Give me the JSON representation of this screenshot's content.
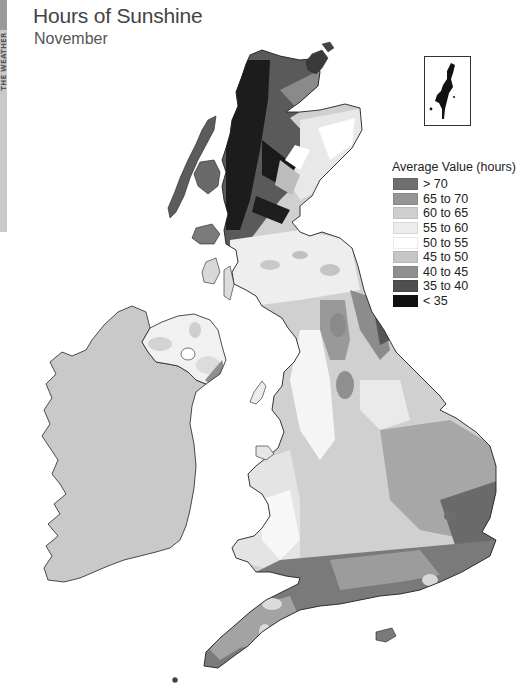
{
  "side_tab": {
    "label": "THE WEATHER"
  },
  "header": {
    "title": "Hours of Sunshine",
    "subtitle": "November"
  },
  "legend": {
    "title": "Average Value (hours)",
    "items": [
      {
        "label": "> 70",
        "color": "#6e6e6e"
      },
      {
        "label": "65 to 70",
        "color": "#959595"
      },
      {
        "label": "60 to 65",
        "color": "#cfcfcf"
      },
      {
        "label": "55 to 60",
        "color": "#ececec"
      },
      {
        "label": "50 to 55",
        "color": "#ffffff"
      },
      {
        "label": "45 to 50",
        "color": "#c6c6c6"
      },
      {
        "label": "40 to 45",
        "color": "#8f8f8f"
      },
      {
        "label": "35 to 40",
        "color": "#4f4f4f"
      },
      {
        "label": "< 35",
        "color": "#111111"
      }
    ]
  },
  "map": {
    "regions": [
      "Scotland",
      "Northern Ireland",
      "Ireland",
      "England",
      "Wales",
      "Shetland (inset)",
      "Orkney",
      "Isle of Man"
    ],
    "colors": {
      "ireland_fill": "#c8c8c8",
      "coastline": "#222222"
    }
  }
}
